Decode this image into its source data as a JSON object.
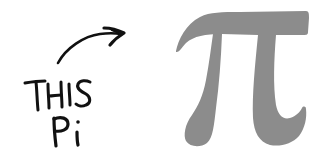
{
  "annotation": {
    "line1": "THIS",
    "line2": "Pi",
    "ink_color": "#111111"
  },
  "arrow": {
    "icon": "curved-arrow-icon",
    "direction": "right"
  },
  "symbol": {
    "glyph": "π",
    "name": "pi-symbol",
    "color": "#8c8c8c"
  },
  "background": "#ffffff"
}
